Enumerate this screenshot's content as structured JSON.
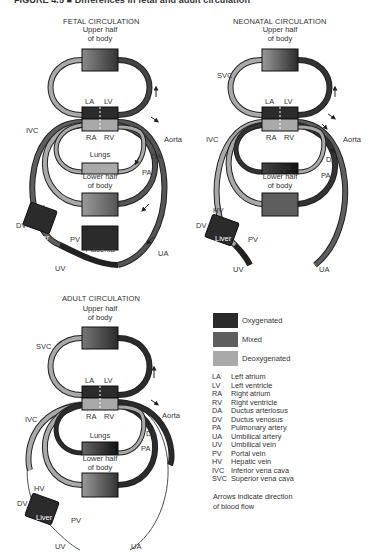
{
  "figure": {
    "title": "FIGURE 4.5 ■ Differences in fetal and adult circulation"
  },
  "colors": {
    "oxygenated": "#2b2b2b",
    "mixed": "#5e5e5e",
    "deoxygenated": "#a9a9a9",
    "vessel_outline": "#1a1a1a",
    "background": "#ffffff"
  },
  "panels": {
    "fetal": {
      "title": "FETAL CIRCULATION",
      "upper_body": [
        "Upper half",
        "of body"
      ],
      "la": "LA",
      "lv": "LV",
      "ra": "RA",
      "rv": "RV",
      "ivc": "IVC",
      "aorta": "Aorta",
      "da": "DA",
      "pa": "PA",
      "lungs": "Lungs",
      "lower_body": [
        "Lower half",
        "of body"
      ],
      "hv": "HV",
      "dv": "DV",
      "liver": "Liver",
      "pv": "PV",
      "placenta": "Placenta",
      "uv": "UV",
      "ua": "UA"
    },
    "neonatal": {
      "title": "NEONATAL CIRCULATION",
      "upper_body": [
        "Upper half",
        "of body"
      ],
      "svc": "SVC",
      "la": "LA",
      "lv": "LV",
      "ra": "RA",
      "rv": "RV",
      "ivc": "IVC",
      "aorta": "Aorta",
      "da": "DA",
      "pa": "PA",
      "lungs": "Lungs",
      "lower_body": [
        "Lower half",
        "of body"
      ],
      "hv": "HV",
      "dv": "DV",
      "liver": "Liver",
      "pv": "PV",
      "uv": "UV",
      "ua": "UA"
    },
    "adult": {
      "title": "ADULT CIRCULATION",
      "upper_body": [
        "Upper half",
        "of body"
      ],
      "svc": "SVC",
      "la": "LA",
      "lv": "LV",
      "ra": "RA",
      "rv": "RV",
      "ivc": "IVC",
      "aorta": "Aorta",
      "da": "DA",
      "pa": "PA",
      "lungs": "Lungs",
      "lower_body": [
        "Lower half",
        "of body"
      ],
      "hv": "HV",
      "dv": "DV",
      "liver": "Liver",
      "pv": "PV",
      "uv": "UV",
      "ua": "UA"
    }
  },
  "legend": {
    "items": [
      {
        "label": "Oxygenated",
        "color": "#2b2b2b"
      },
      {
        "label": "Mixed",
        "color": "#5e5e5e"
      },
      {
        "label": "Deoxygenated",
        "color": "#a9a9a9"
      }
    ]
  },
  "abbreviations": [
    {
      "key": "LA",
      "value": "Left atrium"
    },
    {
      "key": "LV",
      "value": "Left ventricle"
    },
    {
      "key": "RA",
      "value": "Right atrium"
    },
    {
      "key": "RV",
      "value": "Right ventricle"
    },
    {
      "key": "DA",
      "value": "Ductus arteriosus"
    },
    {
      "key": "DV",
      "value": "Ductus venosus"
    },
    {
      "key": "PA",
      "value": "Pulmonary artery"
    },
    {
      "key": "UA",
      "value": "Umbilical artery"
    },
    {
      "key": "UV",
      "value": "Umbilical vein"
    },
    {
      "key": "PV",
      "value": "Portal vein"
    },
    {
      "key": "HV",
      "value": "Hepatic vein"
    },
    {
      "key": "IVC",
      "value": "Inferior vena cava"
    },
    {
      "key": "SVC",
      "value": "Superior vena cava"
    }
  ],
  "note": [
    "Arrows indicate direction",
    "of blood flow"
  ]
}
